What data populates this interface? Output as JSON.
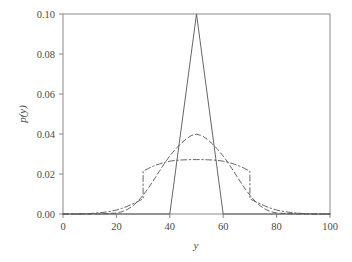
{
  "chart_data": {
    "type": "line",
    "title": "",
    "subtitle": "",
    "xlabel": "y",
    "ylabel": "p(y)",
    "xlim": [
      0,
      100
    ],
    "ylim": [
      0.0,
      0.1
    ],
    "grid": false,
    "legend": "none",
    "xticks": [
      0,
      20,
      40,
      60,
      80,
      100
    ],
    "xtick_labels": [
      "0",
      "20",
      "40",
      "60",
      "80",
      "100"
    ],
    "yticks": [
      0.0,
      0.02,
      0.04,
      0.06,
      0.08,
      0.1
    ],
    "ytick_labels": [
      "0.00",
      "0.02",
      "0.04",
      "0.06",
      "0.08",
      "0.10"
    ],
    "line_color": "#555555",
    "axis_color": "#8a8a8a",
    "series": [
      {
        "name": "triangular",
        "style": "solid",
        "peak_x": 50,
        "peak_y": 0.1,
        "support": [
          40,
          60
        ],
        "x": [
          0,
          40,
          50,
          60,
          100
        ],
        "values": [
          0.0,
          0.0,
          0.1,
          0.0,
          0.0
        ]
      },
      {
        "name": "gaussian",
        "style": "dashed",
        "peak_x": 50,
        "peak_y": 0.0399,
        "x": [
          0,
          5,
          10,
          15,
          20,
          22,
          24,
          26,
          28,
          30,
          32,
          34,
          36,
          38,
          40,
          42,
          44,
          46,
          48,
          50,
          52,
          54,
          56,
          58,
          60,
          62,
          64,
          66,
          68,
          70,
          72,
          74,
          76,
          78,
          80,
          85,
          90,
          95,
          100
        ],
        "values": [
          0.0,
          0.0,
          0.0,
          0.0001,
          0.0005,
          0.0011,
          0.0022,
          0.0039,
          0.0063,
          0.0094,
          0.013,
          0.017,
          0.0212,
          0.0253,
          0.029,
          0.0322,
          0.035,
          0.0374,
          0.0392,
          0.0399,
          0.0392,
          0.0374,
          0.035,
          0.0322,
          0.029,
          0.0253,
          0.0212,
          0.017,
          0.013,
          0.0094,
          0.0063,
          0.0039,
          0.0022,
          0.0011,
          0.0005,
          0.0001,
          0.0,
          0.0,
          0.0
        ]
      },
      {
        "name": "flat-top-mixture",
        "style": "dashdot",
        "peak_x": 50,
        "peak_y": 0.0272,
        "jump_x": [
          30,
          70
        ],
        "jump_y": 0.0214,
        "x": [
          0,
          5,
          10,
          15,
          18,
          20,
          22,
          24,
          26,
          28,
          30,
          30,
          32,
          34,
          36,
          38,
          40,
          42,
          44,
          46,
          48,
          50,
          52,
          54,
          56,
          58,
          60,
          62,
          64,
          66,
          68,
          70,
          70,
          72,
          74,
          76,
          78,
          80,
          82,
          85,
          90,
          95,
          100
        ],
        "values": [
          0.0,
          0.0,
          0.0002,
          0.0008,
          0.0014,
          0.002,
          0.0028,
          0.0038,
          0.005,
          0.0062,
          0.0076,
          0.0214,
          0.0228,
          0.024,
          0.025,
          0.0258,
          0.0264,
          0.0268,
          0.027,
          0.0271,
          0.0272,
          0.0272,
          0.0272,
          0.0271,
          0.027,
          0.0268,
          0.0264,
          0.0258,
          0.025,
          0.024,
          0.0228,
          0.0214,
          0.0076,
          0.0062,
          0.005,
          0.0038,
          0.0028,
          0.002,
          0.0014,
          0.0008,
          0.0002,
          0.0,
          0.0
        ]
      }
    ]
  },
  "axis_labels": {
    "x": "y",
    "y": "p(y)"
  }
}
